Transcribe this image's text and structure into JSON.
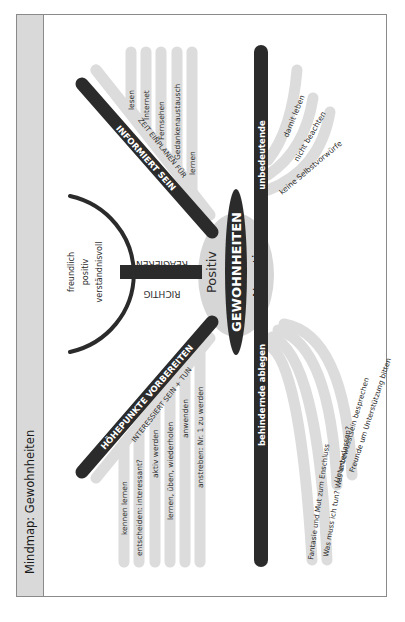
{
  "page": {
    "title": "Mindmap: Gewohnheiten"
  },
  "center": {
    "label": "GEWOHNHEITEN",
    "positive_label": "Positiv",
    "negative_label": "Negativ"
  },
  "positive": {
    "informiert": {
      "label": "INFORMIERT SEIN",
      "sub_label": "ZEIT EINPLANEN FÜR",
      "items": [
        "lesen",
        "Internet",
        "Fernsehen",
        "Gedankenaustausch",
        "lernen"
      ]
    },
    "reagieren": {
      "label_top": "REAGIEREN",
      "label_bottom": "RICHTIG",
      "items": [
        "freundlich",
        "positiv",
        "verständnisvoll"
      ]
    },
    "hoehepunkte": {
      "label": "HÖHEPUNKTE VORBEREITEN",
      "sub_label": "INTERESSIERT SEIN + TUN",
      "items": [
        "kennen lernen",
        "entscheiden: interessant?",
        "aktiv werden",
        "lernen, üben, wiederholen",
        "anwenden",
        "anstreben: Nr. 1 zu werden"
      ]
    }
  },
  "negative": {
    "unbedeutende": {
      "label": "unbedeutende",
      "items": [
        "damit leben",
        "nicht beachten",
        "keine Selbstvorwürfe"
      ]
    },
    "behindernde": {
      "label": "behindernde ablegen",
      "items": [
        "Fantasie und Mut zum Enschluss",
        "Was muss ich tun? Was unterlassen?",
        "Unterbewusstsein besprechen",
        "Freunde um Unterstützung bitten"
      ]
    }
  },
  "colors": {
    "dark": "#2b2b2b",
    "light_branch": "#dcdcdc",
    "oval_gray": "#d6d6d6",
    "title_strip": "#d9d9d9",
    "frame": "#8a8a8a"
  }
}
